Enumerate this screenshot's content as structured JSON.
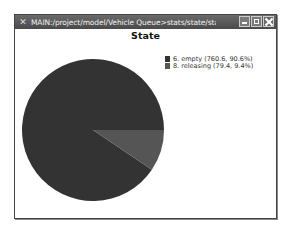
{
  "window": {
    "title": "MAIN:/project/model/Vehicle Queue>stats/state/state_prof...",
    "app_icon": "x11-icon",
    "buttons": {
      "minimize": "minimize",
      "maximize": "maximize",
      "close": "close"
    }
  },
  "chart": {
    "title": "State",
    "legend": [
      {
        "label": "6. empty (760.6, 90.6%)",
        "color": "#333333"
      },
      {
        "label": "8. releasing (79.4, 9.4%)",
        "color": "#555555"
      }
    ]
  },
  "chart_data": {
    "type": "pie",
    "title": "State",
    "categories": [
      "6. empty",
      "8. releasing"
    ],
    "values": [
      760.6,
      79.4
    ],
    "percentages": [
      90.6,
      9.4
    ],
    "colors": [
      "#333333",
      "#555555"
    ],
    "legend_position": "right"
  }
}
